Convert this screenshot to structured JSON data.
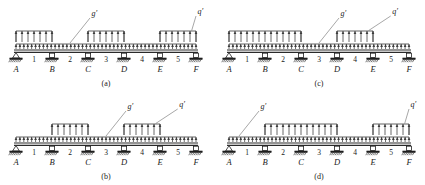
{
  "figure": {
    "supports": [
      "A",
      "B",
      "C",
      "D",
      "E",
      "F"
    ],
    "support_types": [
      "pin",
      "roller",
      "roller",
      "roller",
      "roller",
      "roller"
    ],
    "span_labels": [
      "1",
      "2",
      "3",
      "4",
      "5"
    ],
    "load_labels": {
      "dead": "g",
      "live": "q",
      "prime": "′"
    },
    "colors": {
      "ink": "#1f1f1f",
      "line": "#3a3a3a",
      "leader": "#6b6b6b",
      "paper": "#ffffff"
    }
  },
  "panels": [
    {
      "key": "a",
      "caption": "(a)",
      "dead_load_label": "g′",
      "live_load_label": "q′",
      "dead_load_extent": [
        0,
        5
      ],
      "live_load_segments": [
        [
          0,
          1
        ],
        [
          2,
          3
        ],
        [
          4,
          5
        ]
      ],
      "live_load_span_numbers": [
        "1",
        "3",
        "5"
      ]
    },
    {
      "key": "b",
      "caption": "(b)",
      "dead_load_label": "g′",
      "live_load_label": "q′",
      "dead_load_extent": [
        0,
        5
      ],
      "live_load_segments": [
        [
          1,
          2
        ],
        [
          3,
          4
        ]
      ],
      "live_load_span_numbers": [
        "2",
        "4"
      ]
    },
    {
      "key": "c",
      "caption": "(c)",
      "dead_load_label": "g′",
      "live_load_label": "q′",
      "dead_load_extent": [
        0,
        5
      ],
      "live_load_segments": [
        [
          0,
          2
        ],
        [
          3,
          4
        ]
      ],
      "live_load_span_numbers": [
        "1",
        "2",
        "4"
      ]
    },
    {
      "key": "d",
      "caption": "(d)",
      "dead_load_label": "g′",
      "live_load_label": "q′",
      "dead_load_extent": [
        0,
        5
      ],
      "live_load_segments": [
        [
          1,
          3
        ],
        [
          4,
          5
        ]
      ],
      "live_load_span_numbers": [
        "2",
        "3",
        "5"
      ]
    }
  ]
}
